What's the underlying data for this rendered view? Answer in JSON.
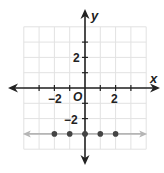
{
  "graph": {
    "x_axis_label": "x",
    "y_axis_label": "y",
    "origin_label": "O",
    "x_tick_labels": [
      {
        "value": -2,
        "text": "−2"
      },
      {
        "value": 2,
        "text": "2"
      }
    ],
    "y_tick_labels": [
      {
        "value": 2,
        "text": "2"
      },
      {
        "value": -2,
        "text": "−2"
      }
    ],
    "grid_range": {
      "x": [
        -4,
        4
      ],
      "y": [
        -4,
        4
      ]
    },
    "colors": {
      "axis": "#222222",
      "grid": "#e2e2e2",
      "line": "#b5b5b5",
      "points": "#444444"
    }
  },
  "chart_data": {
    "type": "scatter",
    "title": "",
    "xlabel": "x",
    "ylabel": "y",
    "xlim": [
      -4,
      4
    ],
    "ylim": [
      -4,
      4
    ],
    "grid": true,
    "series": [
      {
        "name": "points",
        "x": [
          -2,
          -1,
          0,
          1,
          2
        ],
        "y": [
          -3,
          -3,
          -3,
          -3,
          -3
        ]
      },
      {
        "name": "line y = -3",
        "type": "line",
        "x": [
          -4,
          4
        ],
        "y": [
          -3,
          -3
        ]
      }
    ]
  }
}
